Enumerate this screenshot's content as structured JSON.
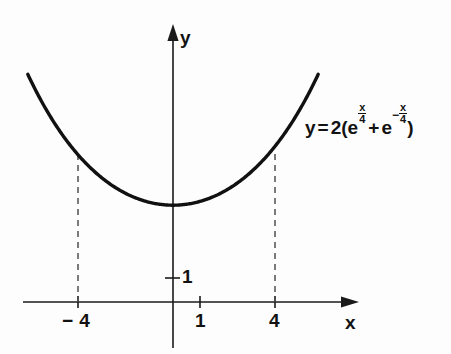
{
  "figure": {
    "background_color": "#fdfdfd",
    "ink_color": "#121212",
    "curve_color": "#111111",
    "dash_color": "#555555"
  },
  "axes": {
    "x_axis_label": "x",
    "y_axis_label": "y",
    "x_ticks": [
      {
        "label": "− 4",
        "value": -4
      },
      {
        "label": "1",
        "value": 1
      },
      {
        "label": "4",
        "value": 4
      }
    ],
    "y_ticks": [
      {
        "label": "1",
        "value": 1
      }
    ],
    "xlim": [
      -7.2,
      7.4
    ],
    "ylim": [
      -2.1,
      11.6
    ],
    "grid": false
  },
  "equation": {
    "full_text": "y = 2(e^(x/4) + e^(-x/4))",
    "lhs": "y",
    "equals": "=",
    "coefficient": "2",
    "open_paren": "(",
    "base_first": "e",
    "exp_first_numerator": "x",
    "exp_first_denominator": "4",
    "plus": "+",
    "base_second": "e",
    "minus_sign": "−",
    "exp_second_numerator": "x",
    "exp_second_denominator": "4",
    "close_paren": ")"
  },
  "annotations": {
    "dashed_guides": [
      {
        "name": "guide-at-x-minus-4",
        "x": -4,
        "y_top": 6.17
      },
      {
        "name": "guide-at-x-plus-4",
        "x": 4,
        "y_top": 6.17
      }
    ]
  },
  "chart_data": {
    "type": "line",
    "title": "",
    "xlabel": "x",
    "ylabel": "y",
    "xlim": [
      -7.2,
      7.4
    ],
    "ylim": [
      -2.1,
      11.6
    ],
    "grid": false,
    "legend": null,
    "function": "y = 2(e^(x/4) + e^(-x/4))",
    "series": [
      {
        "name": "y = 2(e^(x/4) + e^(-x/4))",
        "x": [
          -6.0,
          -5.5,
          -5.0,
          -4.5,
          -4.0,
          -3.5,
          -3.0,
          -2.5,
          -2.0,
          -1.5,
          -1.0,
          -0.5,
          0.0,
          0.5,
          1.0,
          1.5,
          2.0,
          2.5,
          3.0,
          3.5,
          4.0,
          4.5,
          5.0,
          5.5,
          6.0
        ],
        "values": [
          9.41,
          8.6,
          7.9,
          7.28,
          6.76,
          6.32,
          5.94,
          5.63,
          5.38,
          5.18,
          5.03,
          4.92,
          4.0,
          4.92,
          5.03,
          5.18,
          5.38,
          5.63,
          5.94,
          6.32,
          6.76,
          7.28,
          7.9,
          8.6,
          9.41
        ]
      }
    ],
    "key_points": [
      {
        "label": "minimum",
        "x": 0,
        "y": 4.0
      },
      {
        "label": "marked-left",
        "x": -4,
        "y": 6.17
      },
      {
        "label": "marked-right",
        "x": 4,
        "y": 6.17
      }
    ],
    "annotations": [
      {
        "text": "y = 2(e^(x/4) + e^(-x/4))",
        "x": 5.5,
        "y": 8.3
      }
    ]
  }
}
